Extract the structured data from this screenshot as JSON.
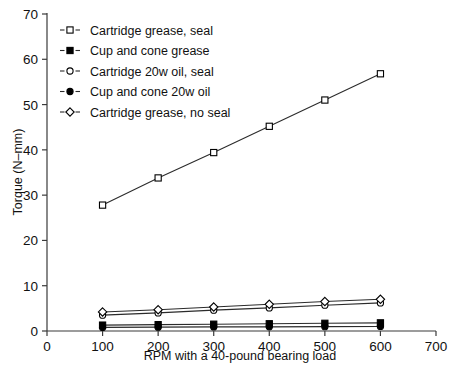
{
  "chart_data": {
    "type": "line",
    "title": "",
    "xlabel": "RPM with a 40-pound bearing load",
    "ylabel": "Torque (N–mm)",
    "x": [
      100,
      200,
      300,
      400,
      500,
      600
    ],
    "xlim": [
      0,
      700
    ],
    "ylim": [
      0,
      70
    ],
    "xticks": [
      "0",
      "100",
      "200",
      "300",
      "400",
      "500",
      "600",
      "700"
    ],
    "yticks": [
      "0",
      "10",
      "20",
      "30",
      "40",
      "50",
      "60",
      "70"
    ],
    "grid": false,
    "legend_position": "upper-left-inside",
    "series": [
      {
        "name": "Cartridge grease, seal",
        "marker": "open-square",
        "values": [
          27.8,
          33.8,
          39.4,
          45.2,
          51.0,
          56.8
        ]
      },
      {
        "name": "Cup and cone grease",
        "marker": "filled-square",
        "values": [
          1.3,
          1.4,
          1.5,
          1.6,
          1.7,
          1.8
        ]
      },
      {
        "name": "Cartridge 20w oil, seal",
        "marker": "open-circle",
        "values": [
          3.5,
          4.0,
          4.6,
          5.1,
          5.7,
          6.2
        ]
      },
      {
        "name": "Cup and cone 20w oil",
        "marker": "filled-circle",
        "values": [
          0.8,
          0.85,
          0.9,
          0.92,
          0.96,
          1.0
        ]
      },
      {
        "name": "Cartridge grease, no seal",
        "marker": "open-diamond",
        "values": [
          4.2,
          4.7,
          5.3,
          5.9,
          6.5,
          7.0
        ]
      }
    ]
  },
  "legend": {
    "entries": [
      {
        "label": "Cartridge grease, seal",
        "marker": "open-square"
      },
      {
        "label": "Cup and cone grease",
        "marker": "filled-square"
      },
      {
        "label": "Cartridge 20w oil, seal",
        "marker": "open-circle"
      },
      {
        "label": "Cup and cone 20w oil",
        "marker": "filled-circle"
      },
      {
        "label": "Cartridge grease, no seal",
        "marker": "open-diamond"
      }
    ]
  },
  "colors": {
    "line": "#2b2b2b",
    "axis": "#3a3a3a",
    "text": "#111111",
    "background": "#ffffff",
    "marker_fill_open": "#ffffff",
    "marker_fill_solid": "#000000"
  }
}
